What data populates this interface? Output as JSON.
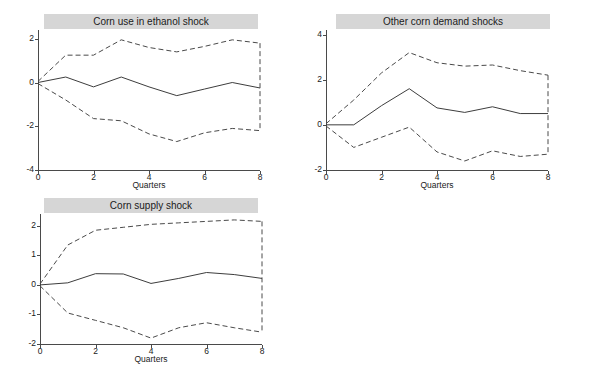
{
  "figure": {
    "background_color": "#ffffff",
    "title_bar_color": "#d6d6d6",
    "line_color": "#3d3d3d",
    "band_color": "#4a4a4a"
  },
  "chart_data": [
    {
      "type": "line",
      "title": "Corn use in ethanol shock",
      "xlabel": "Quarters",
      "ylabel": "",
      "x": [
        0,
        1,
        2,
        3,
        4,
        5,
        6,
        7,
        8
      ],
      "xlim": [
        0,
        8
      ],
      "ylim": [
        -4,
        2.4
      ],
      "xticks": [
        0,
        2,
        4,
        6,
        8
      ],
      "xtick_labels": [
        "0",
        "2",
        "4",
        "6",
        "8"
      ],
      "yticks": [
        2,
        0,
        -2,
        -4
      ],
      "ytick_labels": [
        "2",
        "0",
        "-2",
        "-4"
      ],
      "grid": false,
      "legend": "none",
      "series": [
        {
          "name": "Upper confidence band",
          "style": "dashed",
          "values": [
            0.05,
            1.25,
            1.25,
            1.95,
            1.6,
            1.4,
            1.65,
            1.95,
            1.8
          ]
        },
        {
          "name": "Impulse response",
          "style": "solid",
          "values": [
            0.0,
            0.25,
            -0.2,
            0.25,
            -0.2,
            -0.6,
            -0.3,
            0.0,
            -0.25
          ]
        },
        {
          "name": "Lower confidence band",
          "style": "dashed",
          "values": [
            -0.05,
            -0.8,
            -1.65,
            -1.75,
            -2.35,
            -2.7,
            -2.3,
            -2.1,
            -2.2
          ]
        }
      ]
    },
    {
      "type": "line",
      "title": "Other corn demand shocks",
      "xlabel": "Quarters",
      "ylabel": "",
      "x": [
        0,
        1,
        2,
        3,
        4,
        5,
        6,
        7,
        8
      ],
      "xlim": [
        0,
        8
      ],
      "ylim": [
        -2,
        4.2
      ],
      "xticks": [
        0,
        2,
        4,
        6,
        8
      ],
      "xtick_labels": [
        "0",
        "2",
        "4",
        "6",
        "8"
      ],
      "yticks": [
        4,
        2,
        0,
        -2
      ],
      "ytick_labels": [
        "4",
        "2",
        "0",
        "-2"
      ],
      "grid": false,
      "legend": "none",
      "series": [
        {
          "name": "Upper confidence band",
          "style": "dashed",
          "values": [
            0.05,
            1.1,
            2.3,
            3.2,
            2.75,
            2.6,
            2.65,
            2.4,
            2.2
          ]
        },
        {
          "name": "Impulse response",
          "style": "solid",
          "values": [
            0.0,
            0.0,
            0.85,
            1.6,
            0.75,
            0.55,
            0.8,
            0.5,
            0.5
          ]
        },
        {
          "name": "Lower confidence band",
          "style": "dashed",
          "values": [
            -0.05,
            -1.0,
            -0.55,
            -0.1,
            -1.2,
            -1.6,
            -1.15,
            -1.4,
            -1.3
          ]
        }
      ]
    },
    {
      "type": "line",
      "title": "Corn supply shock",
      "xlabel": "Quarters",
      "ylabel": "",
      "x": [
        0,
        1,
        2,
        3,
        4,
        5,
        6,
        7,
        8
      ],
      "xlim": [
        0,
        8
      ],
      "ylim": [
        -2,
        2.4
      ],
      "xticks": [
        0,
        2,
        4,
        6,
        8
      ],
      "xtick_labels": [
        "0",
        "2",
        "4",
        "6",
        "8"
      ],
      "yticks": [
        2,
        1,
        0,
        -1,
        -2
      ],
      "ytick_labels": [
        "2",
        "1",
        "0",
        "-1",
        "-2"
      ],
      "grid": false,
      "legend": "none",
      "series": [
        {
          "name": "Upper confidence band",
          "style": "dashed",
          "values": [
            0.03,
            1.35,
            1.85,
            1.95,
            2.05,
            2.1,
            2.15,
            2.2,
            2.15
          ]
        },
        {
          "name": "Impulse response",
          "style": "solid",
          "values": [
            0.0,
            0.07,
            0.38,
            0.37,
            0.05,
            0.22,
            0.42,
            0.35,
            0.22
          ]
        },
        {
          "name": "Lower confidence band",
          "style": "dashed",
          "values": [
            -0.03,
            -0.95,
            -1.2,
            -1.45,
            -1.8,
            -1.45,
            -1.28,
            -1.45,
            -1.6
          ]
        }
      ]
    }
  ]
}
